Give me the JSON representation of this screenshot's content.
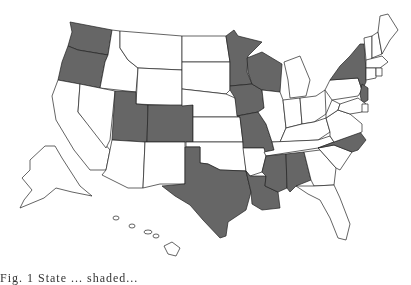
{
  "map": {
    "type": "choropleth",
    "region": "United States",
    "colors": {
      "highlighted": "#666666",
      "default": "#ffffff",
      "border": "#222222"
    },
    "highlighted_states": [
      "WA",
      "OR",
      "UT",
      "CO",
      "MN",
      "WI",
      "IA",
      "MO",
      "TX",
      "LA",
      "MS",
      "AL",
      "NC",
      "NY",
      "NJ"
    ],
    "states": [
      {
        "id": "WA",
        "on": true,
        "pts": "70,22 112,30 108,55 78,50 68,46 72,32"
      },
      {
        "id": "OR",
        "on": true,
        "pts": "68,46 78,50 108,55 105,62 100,88 58,80 62,62"
      },
      {
        "id": "CA",
        "on": false,
        "pts": "58,80 80,84 78,112 110,150 106,170 90,170 74,150 56,120 52,96"
      },
      {
        "id": "ID",
        "on": false,
        "pts": "112,30 120,31 120,48 128,60 138,68 136,92 100,88 105,62 108,55"
      },
      {
        "id": "NV",
        "on": false,
        "pts": "80,84 115,91 110,140 106,148 78,112"
      },
      {
        "id": "MT",
        "on": false,
        "pts": "120,31 182,36 182,70 138,68 128,60 120,48"
      },
      {
        "id": "WY",
        "on": false,
        "pts": "138,68 182,70 182,106 136,104"
      },
      {
        "id": "UT",
        "on": true,
        "pts": "115,91 136,92 136,104 148,105 147,142 112,140"
      },
      {
        "id": "CO",
        "on": true,
        "pts": "148,105 193,105 193,142 147,142"
      },
      {
        "id": "AZ",
        "on": false,
        "pts": "112,140 145,142 143,188 128,188 102,175 106,170 110,150"
      },
      {
        "id": "NM",
        "on": false,
        "pts": "145,142 185,142 185,184 160,184 143,188"
      },
      {
        "id": "ND",
        "on": false,
        "pts": "182,36 226,36 230,62 182,62"
      },
      {
        "id": "SD",
        "on": false,
        "pts": "182,62 230,62 230,90 226,94 182,89"
      },
      {
        "id": "NE",
        "on": false,
        "pts": "182,89 226,94 235,98 240,117 193,117 193,105 182,106"
      },
      {
        "id": "KS",
        "on": false,
        "pts": "193,117 240,117 243,142 193,142"
      },
      {
        "id": "OK",
        "on": false,
        "pts": "186,142 243,142 246,171 220,170 208,164 200,163 200,147 186,147"
      },
      {
        "id": "TX",
        "on": true,
        "pts": "200,147 200,163 208,164 220,170 246,171 251,192 246,210 228,222 226,236 220,238 203,220 190,205 175,196 162,186 185,184 185,147"
      },
      {
        "id": "MN",
        "on": true,
        "pts": "226,36 234,30 238,36 262,42 248,56 247,72 252,84 230,86 230,62"
      },
      {
        "id": "IA",
        "on": true,
        "pts": "230,86 252,84 262,90 264,108 258,112 237,116 235,98 230,90"
      },
      {
        "id": "MO",
        "on": true,
        "pts": "237,116 258,112 266,124 272,142 274,150 264,152 264,148 243,148 243,142 240,117"
      },
      {
        "id": "AR",
        "on": false,
        "pts": "243,148 264,148 266,156 262,172 250,176 246,171"
      },
      {
        "id": "LA",
        "on": true,
        "pts": "246,171 250,176 266,176 265,186 278,192 280,208 262,210 252,204 251,192"
      },
      {
        "id": "WI",
        "on": true,
        "pts": "247,58 262,52 272,58 282,64 280,92 262,90 252,84 248,72"
      },
      {
        "id": "IL",
        "on": false,
        "pts": "262,90 280,92 283,100 286,128 280,142 272,142 266,124 258,112 264,108"
      },
      {
        "id": "MI",
        "on": false,
        "pts": "284,62 300,56 310,80 306,96 290,98 288,80"
      },
      {
        "id": "IN",
        "on": false,
        "pts": "283,100 300,98 302,124 286,128"
      },
      {
        "id": "OH",
        "on": false,
        "pts": "300,98 316,96 325,90 326,114 314,122 302,124"
      },
      {
        "id": "KY",
        "on": false,
        "pts": "280,142 286,128 302,124 314,122 326,118 330,132 318,140"
      },
      {
        "id": "TN",
        "on": false,
        "pts": "272,142 318,140 330,136 334,142 318,148 266,156 264,152 274,150"
      },
      {
        "id": "MS",
        "on": true,
        "pts": "266,156 286,154 287,188 278,192 265,186 266,176 262,172"
      },
      {
        "id": "AL",
        "on": true,
        "pts": "286,154 304,152 311,180 296,186 290,192 287,188"
      },
      {
        "id": "GA",
        "on": false,
        "pts": "304,152 320,150 336,168 334,185 314,186 311,180"
      },
      {
        "id": "FL",
        "on": false,
        "pts": "296,186 314,186 334,185 340,198 350,224 346,240 338,238 330,218 320,200 308,194"
      },
      {
        "id": "SC",
        "on": false,
        "pts": "318,148 334,145 352,152 340,170 336,168 320,150"
      },
      {
        "id": "NC",
        "on": true,
        "pts": "334,142 360,132 366,140 358,150 352,152 334,145 318,148"
      },
      {
        "id": "VA",
        "on": false,
        "pts": "326,118 338,110 350,114 362,124 362,132 334,142 330,136 330,132"
      },
      {
        "id": "WV",
        "on": false,
        "pts": "326,114 332,100 340,104 338,110 326,118"
      },
      {
        "id": "PA",
        "on": false,
        "pts": "325,90 330,80 358,78 362,90 358,96 332,100"
      },
      {
        "id": "NY",
        "on": true,
        "pts": "330,80 340,66 350,56 360,44 364,44 366,70 366,82 362,90 358,78"
      },
      {
        "id": "NJ",
        "on": true,
        "pts": "362,84 368,88 368,100 362,104 360,94"
      },
      {
        "id": "MD",
        "on": false,
        "pts": "340,104 358,98 366,104 362,112 350,114 338,110"
      },
      {
        "id": "DE",
        "on": false,
        "pts": "362,104 368,104 368,112 362,112"
      },
      {
        "id": "VT",
        "on": false,
        "pts": "364,38 372,36 372,58 368,62 366,60"
      },
      {
        "id": "NH",
        "on": false,
        "pts": "372,36 378,32 382,54 372,58"
      },
      {
        "id": "ME",
        "on": false,
        "pts": "378,32 380,16 388,14 398,30 390,40 382,54"
      },
      {
        "id": "MA",
        "on": false,
        "pts": "366,60 382,56 388,62 380,68 366,68"
      },
      {
        "id": "CT",
        "on": false,
        "pts": "366,68 376,68 376,78 366,80"
      },
      {
        "id": "RI",
        "on": false,
        "pts": "376,68 382,68 382,76 376,76"
      }
    ],
    "insets": {
      "alaska": "30,160 45,146 55,146 62,158 80,186 92,196 72,192 56,188 44,198 20,208 24,200 32,190 22,178 30,170",
      "hawaii": [
        {
          "cx": 116,
          "cy": 218,
          "rx": 3,
          "ry": 2
        },
        {
          "cx": 132,
          "cy": 226,
          "rx": 3,
          "ry": 2
        },
        {
          "cx": 148,
          "cy": 232,
          "rx": 4,
          "ry": 2
        },
        {
          "cx": 156,
          "cy": 236,
          "rx": 3,
          "ry": 2
        },
        "164,246 172,242 180,248 176,256 168,254"
      ]
    }
  },
  "caption": {
    "text": "Fig. 1 State ... shaded... "
  }
}
